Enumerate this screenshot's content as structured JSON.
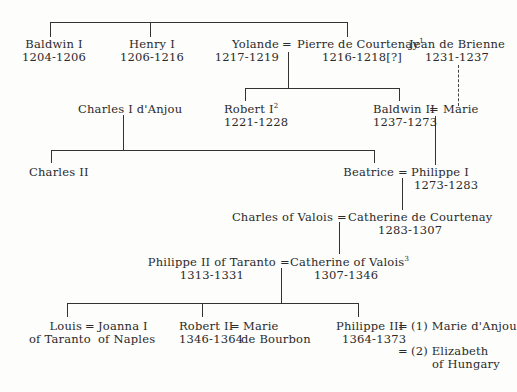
{
  "diagram": {
    "type": "genealogy-tree",
    "persons": {
      "baldwin1": {
        "name": "Baldwin I",
        "dates": "1204-1206"
      },
      "henry1": {
        "name": "Henry I",
        "dates": "1206-1216"
      },
      "yolande": {
        "name": "Yolande",
        "dates": "1217-1219"
      },
      "pierre": {
        "name": "Pierre de Courtenay",
        "note": "1",
        "dates": "1216-1218[?]"
      },
      "jean": {
        "name": "Jean de Brienne",
        "dates": "1231-1237"
      },
      "charles1": {
        "name": "Charles I d'Anjou"
      },
      "robert1": {
        "name": "Robert I",
        "note": "2",
        "dates": "1221-1228"
      },
      "baldwin2": {
        "name": "Baldwin II",
        "dates": "1237-1273"
      },
      "marie": {
        "name": "Marie"
      },
      "charles2": {
        "name": "Charles II"
      },
      "beatrice": {
        "name": "Beatrice"
      },
      "philippe1": {
        "name": "Philippe I",
        "dates": "1273-1283"
      },
      "charlesvalois": {
        "name": "Charles of Valois"
      },
      "catherinecourtenay": {
        "name": "Catherine de Courtenay",
        "dates": "1283-1307"
      },
      "philippe2": {
        "name": "Philippe II of Taranto",
        "dates": "1313-1331"
      },
      "catherinevalois": {
        "name": "Catherine of Valois",
        "note": "3",
        "dates": "1307-1346"
      },
      "louis": {
        "name": "Louis",
        "line2": "of Taranto"
      },
      "joanna": {
        "name": "Joanna I",
        "line2": "of Naples"
      },
      "robert2": {
        "name": "Robert II",
        "dates": "1346-1364"
      },
      "mariebourbon": {
        "name": "Marie",
        "line2": "de Bourbon"
      },
      "philippe3": {
        "name": "Philippe III",
        "dates": "1364-1373"
      },
      "marieanjou": {
        "name": "(1) Marie d'Anjou"
      },
      "elizabeth": {
        "name": "(2) Elizabeth",
        "line2": "of Hungary"
      }
    },
    "symbols": {
      "marriage": "="
    }
  }
}
